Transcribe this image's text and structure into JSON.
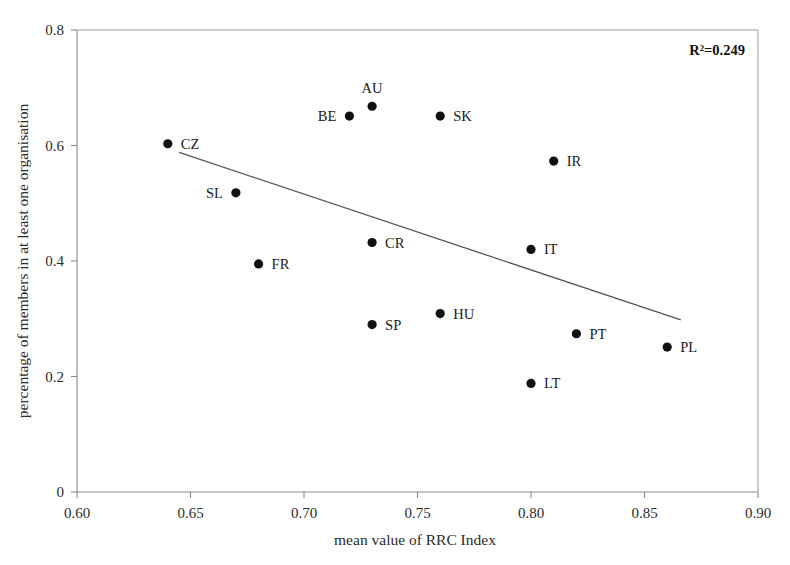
{
  "chart_data": {
    "type": "scatter",
    "title": "",
    "xlabel": "mean value of RRC Index",
    "ylabel": "percentage of members in at least one organisation",
    "xlim": [
      0.6,
      0.9
    ],
    "ylim": [
      0,
      0.8
    ],
    "xticks": [
      "0.60",
      "0.65",
      "0.70",
      "0.75",
      "0.80",
      "0.85",
      "0.90"
    ],
    "xtick_values": [
      0.6,
      0.65,
      0.7,
      0.75,
      0.8,
      0.85,
      0.9
    ],
    "yticks": [
      "0",
      "0.2",
      "0.4",
      "0.6",
      "0.8"
    ],
    "ytick_values": [
      0,
      0.2,
      0.4,
      0.6,
      0.8
    ],
    "grid": false,
    "legend": "none",
    "annotation": "R²=0.249",
    "r_squared": 0.249,
    "trendline": {
      "x": [
        0.645,
        0.866
      ],
      "y": [
        0.588,
        0.298
      ]
    },
    "points": [
      {
        "label": "CZ",
        "x": 0.64,
        "y": 0.603,
        "label_pos": "right"
      },
      {
        "label": "SL",
        "x": 0.67,
        "y": 0.518,
        "label_pos": "left"
      },
      {
        "label": "FR",
        "x": 0.68,
        "y": 0.395,
        "label_pos": "right"
      },
      {
        "label": "BE",
        "x": 0.72,
        "y": 0.651,
        "label_pos": "left"
      },
      {
        "label": "AU",
        "x": 0.73,
        "y": 0.668,
        "label_pos": "above"
      },
      {
        "label": "CR",
        "x": 0.73,
        "y": 0.432,
        "label_pos": "right"
      },
      {
        "label": "SP",
        "x": 0.73,
        "y": 0.29,
        "label_pos": "right"
      },
      {
        "label": "SK",
        "x": 0.76,
        "y": 0.651,
        "label_pos": "right"
      },
      {
        "label": "HU",
        "x": 0.76,
        "y": 0.309,
        "label_pos": "right"
      },
      {
        "label": "IT",
        "x": 0.8,
        "y": 0.42,
        "label_pos": "right"
      },
      {
        "label": "LT",
        "x": 0.8,
        "y": 0.188,
        "label_pos": "right"
      },
      {
        "label": "IR",
        "x": 0.81,
        "y": 0.573,
        "label_pos": "right"
      },
      {
        "label": "PT",
        "x": 0.82,
        "y": 0.274,
        "label_pos": "right"
      },
      {
        "label": "PL",
        "x": 0.86,
        "y": 0.251,
        "label_pos": "right"
      }
    ]
  },
  "colors": {
    "point": "#111111",
    "axis": "#8c8c8c",
    "frame": "#9a9a9a",
    "trend": "#555555",
    "text": "#2b2b2b",
    "background": "#ffffff"
  }
}
